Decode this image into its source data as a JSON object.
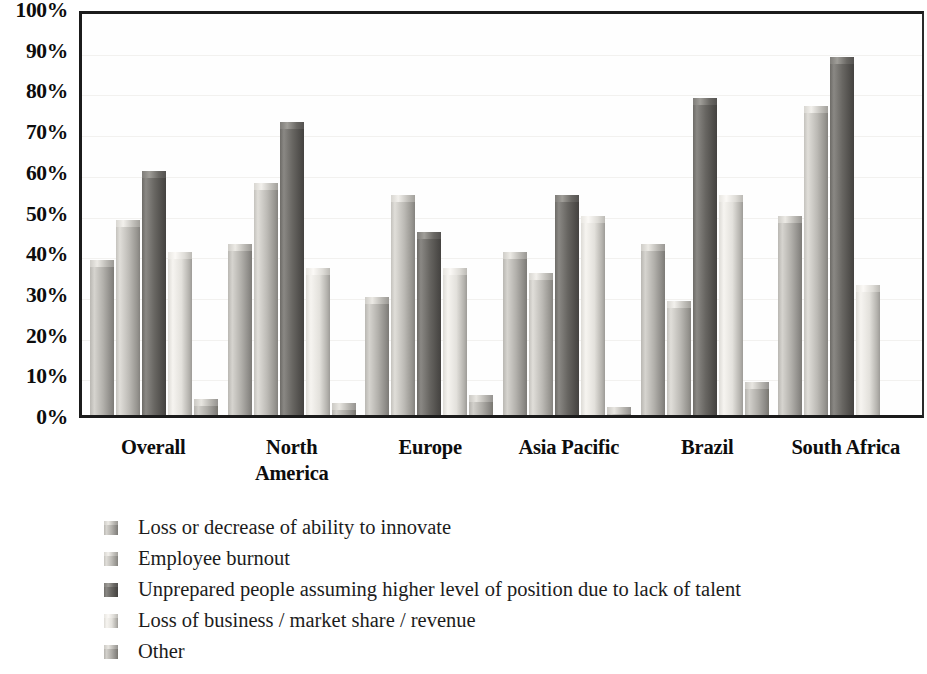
{
  "chart_data": {
    "type": "bar",
    "title": "",
    "subtitle": "",
    "xlabel": "",
    "ylabel": "",
    "ylim": [
      0,
      100
    ],
    "grid": true,
    "legend_position": "bottom-left",
    "categories": [
      "Overall",
      "North\nAmerica",
      "Europe",
      "Asia Pacific",
      "Brazil",
      "South Africa"
    ],
    "y_ticks": [
      "0%",
      "10%",
      "20%",
      "30%",
      "40%",
      "50%",
      "60%",
      "70%",
      "80%",
      "90%",
      "100%"
    ],
    "y_tick_values": [
      0,
      10,
      20,
      30,
      40,
      50,
      60,
      70,
      80,
      90,
      100
    ],
    "series": [
      {
        "name": "Loss or decrease of ability to innovate",
        "color": "#b2b0ab",
        "values": [
          38,
          42,
          29,
          40,
          42,
          49
        ]
      },
      {
        "name": "Employee burnout",
        "color": "#bcbab5",
        "values": [
          48,
          57,
          54,
          35,
          28,
          76
        ]
      },
      {
        "name": "Unprepared people assuming higher level of position due to lack of talent",
        "color": "#686662",
        "values": [
          60,
          72,
          45,
          54,
          78,
          88
        ]
      },
      {
        "name": "Loss of business / market share / revenue",
        "color": "#e3e1dc",
        "values": [
          40,
          36,
          36,
          49,
          54,
          32
        ]
      },
      {
        "name": "Other",
        "color": "#aeaca7",
        "values": [
          4,
          3,
          5,
          2,
          8,
          null
        ]
      }
    ]
  },
  "x_tick_labels": [
    "Overall",
    "North<br>America",
    "Europe",
    "Asia Pacific",
    "Brazil",
    "South Africa"
  ],
  "legend": {
    "items": [
      {
        "label": "Loss or decrease of ability to innovate"
      },
      {
        "label": "Employee burnout"
      },
      {
        "label": "Unprepared people assuming higher level of position due to lack of talent"
      },
      {
        "label": "Loss of business / market share / revenue"
      },
      {
        "label": "Other"
      }
    ]
  }
}
